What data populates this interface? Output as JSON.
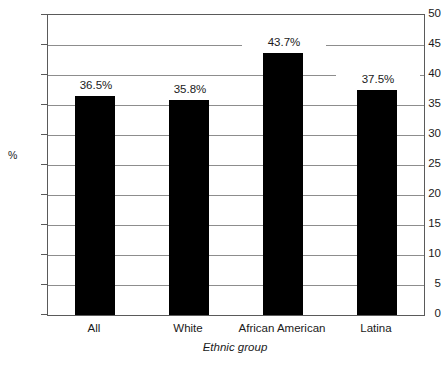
{
  "chart_data": {
    "type": "bar",
    "title": "",
    "categories": [
      "All",
      "White",
      "African American",
      "Latina"
    ],
    "values": [
      36.5,
      35.8,
      43.7,
      37.5
    ],
    "data_labels": [
      "36.5%",
      "35.8%",
      "43.7%",
      "37.5%"
    ],
    "xlabel": "Ethnic group",
    "ylabel": "%",
    "ylim": [
      0,
      50
    ],
    "ytick_values": [
      0,
      5,
      10,
      15,
      20,
      25,
      30,
      35,
      40,
      45,
      50
    ],
    "ytick_labels": [
      "0",
      "5",
      "10",
      "15",
      "20",
      "25",
      "30",
      "35",
      "40",
      "45",
      "50"
    ],
    "grid": true,
    "legend": false,
    "bar_color": "#000000",
    "grid_color": "#8d8d8d",
    "axis_color": "#5a5a5a",
    "background": "#ffffff"
  }
}
